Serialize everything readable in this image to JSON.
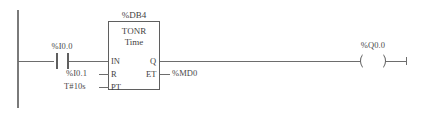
{
  "diagram": {
    "type": "ladder-logic-rung",
    "network_label": "",
    "left_rail": {
      "name": "power-rail"
    },
    "contact": {
      "label": "%I0.0",
      "kind": "normally-open-contact"
    },
    "function_block": {
      "instance_label": "%DB4",
      "name": "TONR",
      "data_type": "Time",
      "inputs": [
        {
          "pin": "IN",
          "operand": ""
        },
        {
          "pin": "R",
          "operand": "%I0.1"
        },
        {
          "pin": "PT",
          "operand": "T#10s"
        }
      ],
      "outputs": [
        {
          "pin": "Q",
          "operand": ""
        },
        {
          "pin": "ET",
          "operand": "%MD0"
        }
      ]
    },
    "coil": {
      "label": "%Q0.0",
      "kind": "output-coil"
    },
    "colors": {
      "line": "#6d6d6d",
      "block_border": "#5f6060",
      "text": "#444444",
      "background": "#ffffff"
    }
  }
}
